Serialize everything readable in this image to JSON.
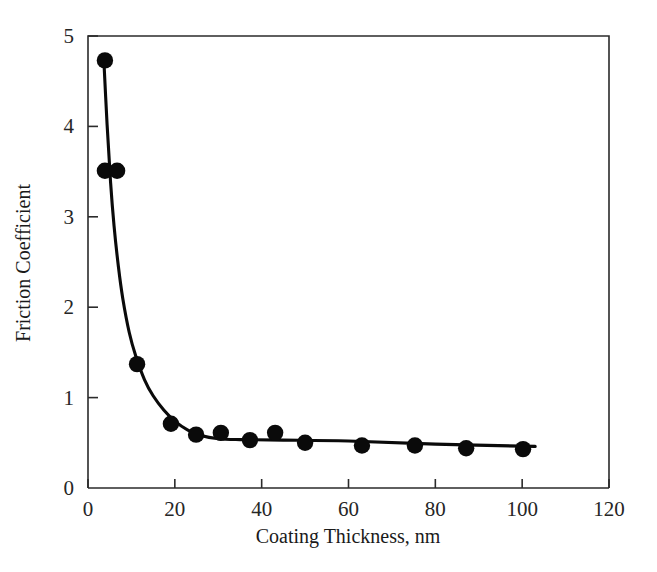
{
  "chart_data": {
    "type": "scatter",
    "title": "",
    "subtitle": "",
    "xlabel": "Coating Thickness, nm",
    "ylabel": "Friction Coefficient",
    "xlim": [
      0,
      120
    ],
    "ylim": [
      0,
      5
    ],
    "xticks": [
      0,
      20,
      40,
      60,
      80,
      100,
      120
    ],
    "yticks": [
      0,
      1,
      2,
      3,
      4,
      5
    ],
    "xtick_labels": [
      "0",
      "20",
      "40",
      "60",
      "80",
      "100",
      "120"
    ],
    "ytick_labels": [
      "0",
      "1",
      "2",
      "3",
      "4",
      "5"
    ],
    "grid": false,
    "legend": false,
    "legend_position": "none",
    "marker": "filled-circle",
    "marker_color": "#0a0a0a",
    "curve_color": "#0a0a0a",
    "frame_color": "#2b2b2b",
    "background_color": "#ffffff",
    "series": [
      {
        "name": "Friction Coefficient vs Coating Thickness",
        "points": [
          {
            "x": 3.9,
            "y": 4.73
          },
          {
            "x": 3.9,
            "y": 3.51
          },
          {
            "x": 6.7,
            "y": 3.51
          },
          {
            "x": 11.3,
            "y": 1.37
          },
          {
            "x": 19.1,
            "y": 0.71
          },
          {
            "x": 24.9,
            "y": 0.59
          },
          {
            "x": 30.6,
            "y": 0.61
          },
          {
            "x": 37.3,
            "y": 0.53
          },
          {
            "x": 43.1,
            "y": 0.61
          },
          {
            "x": 50.0,
            "y": 0.5
          },
          {
            "x": 63.1,
            "y": 0.47
          },
          {
            "x": 75.3,
            "y": 0.47
          },
          {
            "x": 87.1,
            "y": 0.44
          },
          {
            "x": 100.2,
            "y": 0.43
          }
        ]
      }
    ],
    "fit_curve": {
      "name": "exponential-decay fit",
      "points": [
        {
          "x": 3.6,
          "y": 4.78
        },
        {
          "x": 4.4,
          "y": 4.02
        },
        {
          "x": 5.2,
          "y": 3.38
        },
        {
          "x": 6.0,
          "y": 2.9
        },
        {
          "x": 7.0,
          "y": 2.45
        },
        {
          "x": 8.0,
          "y": 2.1
        },
        {
          "x": 9.5,
          "y": 1.72
        },
        {
          "x": 11.0,
          "y": 1.46
        },
        {
          "x": 13.0,
          "y": 1.2
        },
        {
          "x": 15.0,
          "y": 1.02
        },
        {
          "x": 17.5,
          "y": 0.86
        },
        {
          "x": 20.0,
          "y": 0.74
        },
        {
          "x": 23.0,
          "y": 0.64
        },
        {
          "x": 26.0,
          "y": 0.58
        },
        {
          "x": 30.0,
          "y": 0.545
        },
        {
          "x": 35.0,
          "y": 0.535
        },
        {
          "x": 45.0,
          "y": 0.53
        },
        {
          "x": 60.0,
          "y": 0.52
        },
        {
          "x": 80.0,
          "y": 0.485
        },
        {
          "x": 103.0,
          "y": 0.46
        }
      ]
    }
  }
}
